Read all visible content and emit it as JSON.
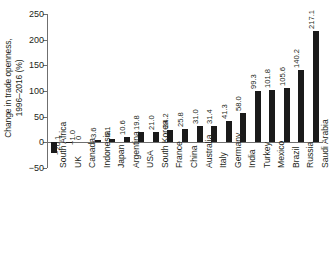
{
  "chart_data": {
    "type": "bar",
    "title": "",
    "xlabel": "",
    "ylabel": "Change in trade openness, 1996–2016 (%)",
    "ylabel_line1": "Change in trade openness,",
    "ylabel_line2": "1996–2016 (%)",
    "ylim": [
      -50,
      250
    ],
    "yticks": [
      250,
      200,
      150,
      100,
      50,
      0,
      -50
    ],
    "ytick_labels": [
      "250",
      "200",
      "150",
      "100",
      "50",
      "0",
      "−50"
    ],
    "grid": false,
    "legend": null,
    "bar_color": "#1a1a1a",
    "axis_color": "#6f6f6f",
    "categories": [
      "South Africa",
      "UK",
      "Canada",
      "Indonesia",
      "Japan",
      "Argentina",
      "USA",
      "South Korea",
      "France",
      "China",
      "Australia",
      "Italy",
      "Germany",
      "India",
      "Turkey",
      "Mexico",
      "Brazil",
      "Russia",
      "Saudi Arabia"
    ],
    "values": [
      -20.1,
      -1.0,
      0,
      3.6,
      6.1,
      10.6,
      19.8,
      21.0,
      24.2,
      25.8,
      31.0,
      31.4,
      41.3,
      58.0,
      99.3,
      101.8,
      105.6,
      140.2,
      217.1
    ],
    "value_labels": [
      "−20.1",
      "−1.0",
      "0",
      "3.6",
      "6.1",
      "10.6",
      "19.8",
      "21.0",
      "24.2",
      "25.8",
      "31.0",
      "31.4",
      "41.3",
      "58.0",
      "99.3",
      "101.8",
      "105.6",
      "140.2",
      "217.1"
    ]
  }
}
